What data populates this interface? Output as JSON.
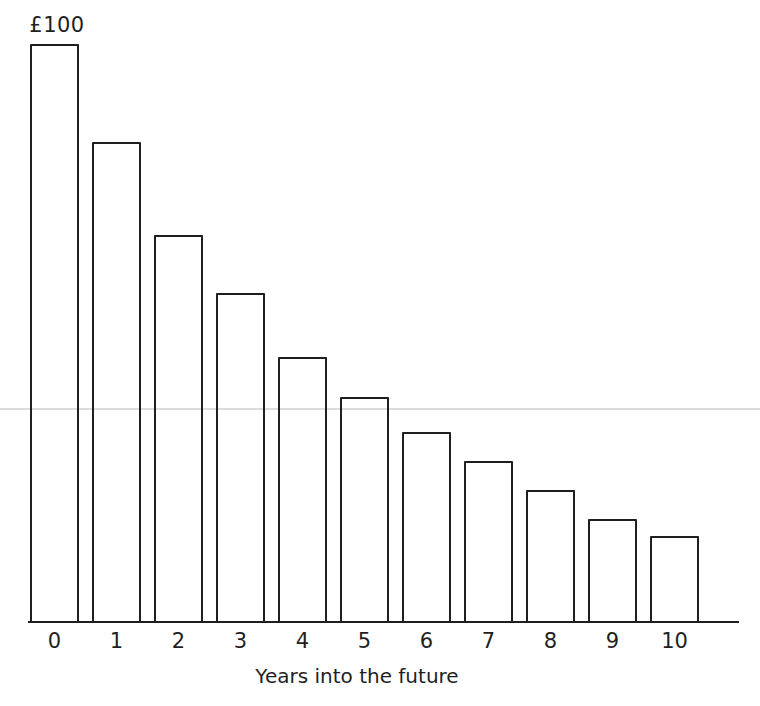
{
  "figure": {
    "background_color": "#ffffff",
    "ink_color": "#1f1f1f",
    "artifact_line_color": "#dcdcdc"
  },
  "chart_data": {
    "type": "bar",
    "title": "",
    "categories": [
      "0",
      "1",
      "2",
      "3",
      "4",
      "5",
      "6",
      "7",
      "8",
      "9",
      "10"
    ],
    "values": [
      100,
      83,
      67,
      57,
      46,
      39,
      33,
      28,
      23,
      18,
      15
    ],
    "xlabel": "Years into the future",
    "ylabel": "",
    "ylim": [
      0,
      100
    ],
    "grid": false,
    "legend": false,
    "bar_fill": "#ffffff",
    "bar_outline": "#1f1f1f",
    "annotations": [
      {
        "text": "£100",
        "bar_index": 0,
        "position": "above-first-bar"
      }
    ]
  }
}
